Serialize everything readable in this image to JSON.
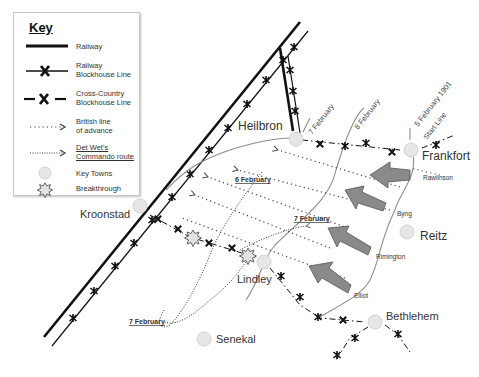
{
  "legend": {
    "title": "Key",
    "items": [
      {
        "symbol": "railway-line",
        "label_1": "Railway",
        "label_2": ""
      },
      {
        "symbol": "railway-blockhouse-line",
        "label_1": "Railway",
        "label_2": "Blockhouse Line"
      },
      {
        "symbol": "cross-country-blockhouse-line",
        "label_1": "Cross-Country",
        "label_2": "Blockhouse Line"
      },
      {
        "symbol": "british-advance-arrow",
        "label_1": "British line",
        "label_2": "of advance"
      },
      {
        "symbol": "commando-route-arrow",
        "label_1": "Det Wet's",
        "label_2": "Commando route"
      },
      {
        "symbol": "town-circle",
        "label_1": "Key Towns",
        "label_2": ""
      },
      {
        "symbol": "breakthrough-star",
        "label_1": "Breakthrough",
        "label_2": ""
      }
    ]
  },
  "towns": [
    {
      "name": "Heilbron",
      "x": 296,
      "y": 139,
      "label_x": 238,
      "label_y": 127,
      "size": 12
    },
    {
      "name": "Frankfort",
      "x": 411,
      "y": 150,
      "label_x": 422,
      "label_y": 157,
      "size": 12
    },
    {
      "name": "Kroonstad",
      "x": 140,
      "y": 206,
      "label_x": 80,
      "label_y": 216,
      "size": 11
    },
    {
      "name": "Reitz",
      "x": 407,
      "y": 232,
      "label_x": 420,
      "label_y": 238,
      "size": 12
    },
    {
      "name": "Lindley",
      "x": 264,
      "y": 262,
      "label_x": 237,
      "label_y": 280,
      "size": 11
    },
    {
      "name": "Bethlehem",
      "x": 375,
      "y": 322,
      "label_x": 386,
      "label_y": 320,
      "size": 11
    },
    {
      "name": "Senekal",
      "x": 204,
      "y": 339,
      "label_x": 216,
      "label_y": 343,
      "size": 11
    }
  ],
  "date_labels": [
    {
      "text": "7 February",
      "x": 312,
      "y": 135,
      "angle": -52,
      "style": "rotated"
    },
    {
      "text": "8 February",
      "x": 358,
      "y": 130,
      "angle": -52,
      "style": "rotated"
    },
    {
      "text": "5  February  1901",
      "x": 419,
      "y": 130,
      "angle": -52,
      "style": "rotated"
    },
    {
      "text": "Start Line",
      "x": 425,
      "y": 142,
      "angle": -52,
      "style": "rotated"
    },
    {
      "text": "6 February",
      "x": 235,
      "y": 180,
      "style": "underlined"
    },
    {
      "text": "7 February",
      "x": 294,
      "y": 222,
      "style": "underlined"
    },
    {
      "text": "7 February",
      "x": 128,
      "y": 326,
      "style": "underlined"
    }
  ],
  "columns": [
    {
      "commander": "Rawlinson",
      "label_x": 424,
      "label_y": 178
    },
    {
      "commander": "Byng",
      "label_x": 397,
      "label_y": 215
    },
    {
      "commander": "Rimington",
      "label_x": 376,
      "label_y": 259
    },
    {
      "commander": "Elliot",
      "label_x": 354,
      "label_y": 298
    }
  ],
  "colors": {
    "railway": "#111111",
    "blockhouse_marker": "#111111",
    "arrow_fill": "#8a8a8a",
    "arrow_stroke": "#555555",
    "town_fill": "#e6e6e6",
    "gray_line": "#8c8c8c",
    "dotted": "#444444"
  }
}
